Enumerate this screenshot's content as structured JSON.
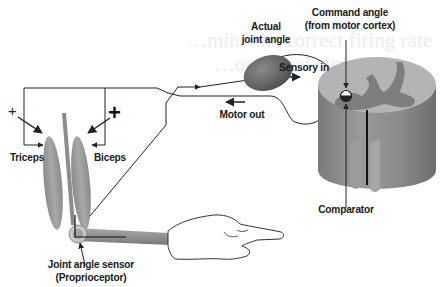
{
  "diagram": {
    "labels": {
      "actual_joint_angle_line1": "Actual",
      "actual_joint_angle_line2": "joint angle",
      "command_angle_line1": "Command angle",
      "command_angle_line2": "(from motor cortex)",
      "sensory_in": "Sensory in",
      "motor_out": "Motor out",
      "triceps": "Triceps",
      "biceps": "Biceps",
      "comparator": "Comparator",
      "joint_sensor_line1": "Joint angle sensor",
      "joint_sensor_line2": "(Proprioceptor)",
      "plus_small": "+",
      "plus_large": "+"
    },
    "colors": {
      "muscle": "#9a9a9a",
      "bone": "#8c8c8c",
      "ganglion": "#6a6a6a",
      "cord_outer": "#8a8a8a",
      "cord_top": "#b4b4b4",
      "grey_matter": "#7a7a7a",
      "line": "#222222",
      "ghost_text": "#ececec"
    },
    "ghost_text": {
      "line1": "…mine the correct firing rate",
      "line2": "…or neural circuit"
    }
  }
}
